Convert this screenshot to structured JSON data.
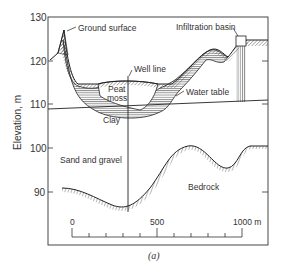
{
  "figure": {
    "caption": "(a)",
    "y_axis": {
      "label": "Elevation, m",
      "ticks": [
        "130",
        "120",
        "110",
        "100",
        "90"
      ]
    },
    "scale_bar": {
      "ticks": [
        "0",
        "500",
        "1000 m"
      ]
    },
    "labels": {
      "ground_surface": "Ground surface",
      "infiltration_basin": "Infiltration basin",
      "well_line": "Well line",
      "peat_moss_1": "Peat",
      "peat_moss_2": "moss",
      "water_table": "Water table",
      "clay": "Clay",
      "sand_gravel": "Sand and gravel",
      "bedrock": "Bedrock"
    }
  },
  "colors": {
    "line": "#222222",
    "text": "#333333",
    "background": "#ffffff"
  }
}
